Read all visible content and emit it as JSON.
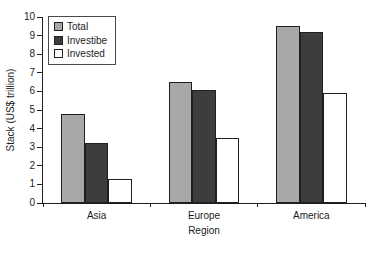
{
  "chart_data": {
    "type": "bar",
    "title": "",
    "xlabel": "Region",
    "ylabel": "Stack (US$ trillion)",
    "categories": [
      "Asia",
      "Europe",
      "America"
    ],
    "series": [
      {
        "name": "Total",
        "color": "#a8a8a8",
        "values": [
          4.8,
          6.5,
          9.5
        ]
      },
      {
        "name": "Investibe",
        "color": "#3d3d3d",
        "values": [
          3.2,
          6.1,
          9.2
        ]
      },
      {
        "name": "Invested",
        "color": "#ffffff",
        "values": [
          1.3,
          3.5,
          5.9
        ]
      }
    ],
    "ylim": [
      0,
      10
    ],
    "yticks": [
      0,
      1,
      2,
      3,
      4,
      5,
      6,
      7,
      8,
      9,
      10
    ],
    "grid": false,
    "legend_position": "top-left-inside",
    "bar_border_color": "#1f1f1f",
    "axis_color": "#1f1f1f"
  }
}
